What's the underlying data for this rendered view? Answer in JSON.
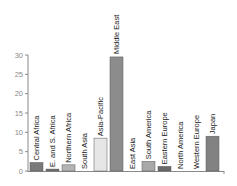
{
  "chart_data": {
    "type": "bar",
    "title": "",
    "xlabel": "",
    "ylabel": "",
    "ylim": [
      0,
      30
    ],
    "yticks": [
      0,
      5,
      10,
      15,
      20,
      25,
      30
    ],
    "grid": false,
    "legend": null,
    "categories": [
      "Central Africa",
      "E. and S. Africa",
      "Northern Africa",
      "South Asia",
      "Asia-Pacific",
      "Middle East",
      "East Asia",
      "South America",
      "Eastern Europe",
      "North America",
      "Western Europe",
      "Japan"
    ],
    "values": [
      2.2,
      0.5,
      1.6,
      0,
      8.5,
      29.5,
      0,
      2.5,
      1.2,
      0,
      0,
      9.0
    ],
    "colors": [
      "#7a7a7a",
      "#6e6e6e",
      "#b4b4b4",
      "#cccccc",
      "#e6e6e6",
      "#8c8c8c",
      "#999999",
      "#a8a8a8",
      "#6a6a6a",
      "#909090",
      "#b0b0b0",
      "#828282"
    ]
  }
}
